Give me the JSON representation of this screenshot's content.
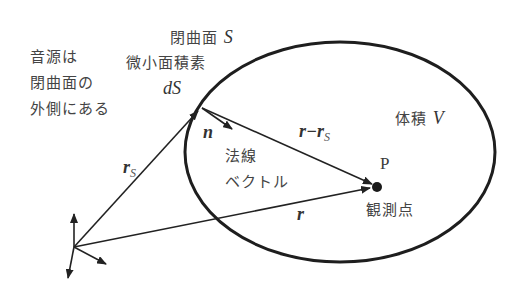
{
  "diagram": {
    "labels": {
      "closed_surface": "閉曲面",
      "closed_surface_symbol": "S",
      "surface_element": "微小面積素",
      "surface_element_symbol": "dS",
      "source_note_line1": "音源は",
      "source_note_line2": "閉曲面の",
      "source_note_line3": "外側にある",
      "volume": "体積",
      "volume_symbol": "V",
      "normal_vector_symbol": "n",
      "normal_vector_line1": "法線",
      "normal_vector_line2": "ベクトル",
      "rs_main": "r",
      "rs_sub": "S",
      "r_minus_rs_main": "r−r",
      "r_minus_rs_sub": "S",
      "r_vector": "r",
      "point_label": "P",
      "observation_point": "観測点"
    },
    "colors": {
      "stroke": "#222222",
      "text": "#3a3a3a"
    }
  }
}
